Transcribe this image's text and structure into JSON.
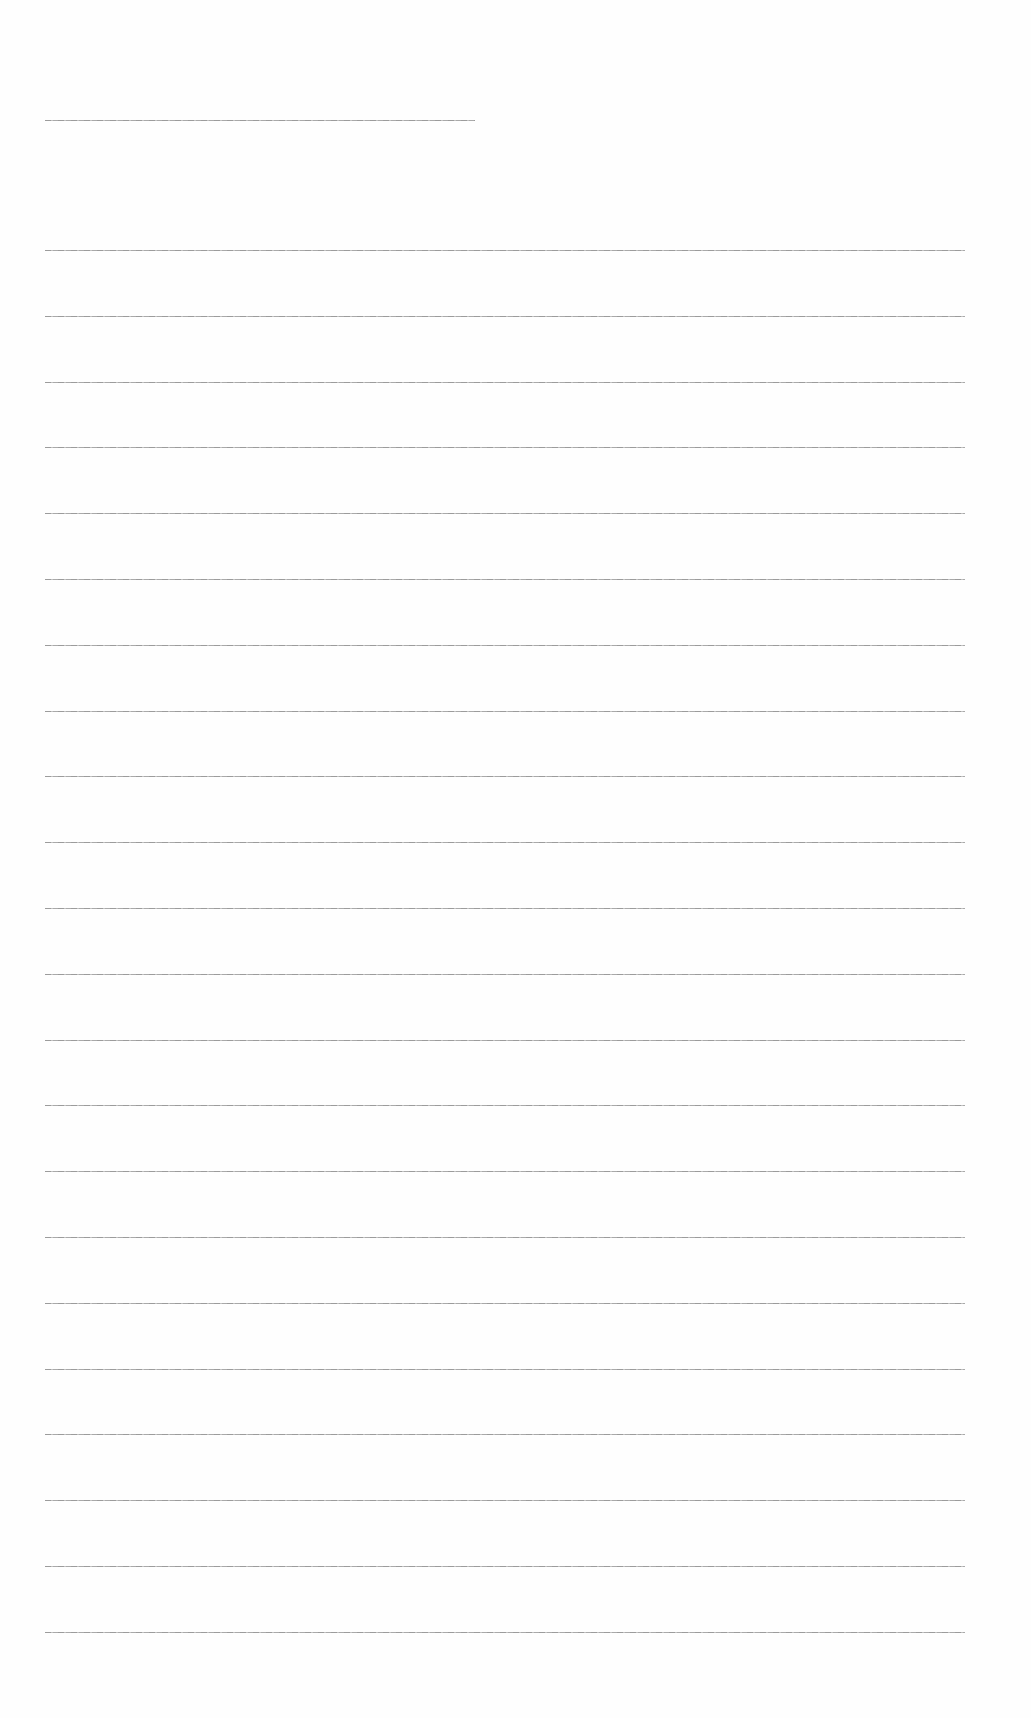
{
  "document": {
    "type": "blank-ruled-page",
    "header_line": {
      "x": 45,
      "y": 120,
      "width": 430
    },
    "ruled_lines": {
      "count": 22,
      "x": 45,
      "width": 920,
      "y_positions": [
        250,
        316,
        382,
        447,
        513,
        579,
        645,
        711,
        776,
        842,
        908,
        974,
        1040,
        1105,
        1171,
        1237,
        1303,
        1369,
        1434,
        1500,
        1566,
        1632
      ]
    },
    "line_color": "#8a8a8a",
    "background_color": "#ffffff"
  }
}
